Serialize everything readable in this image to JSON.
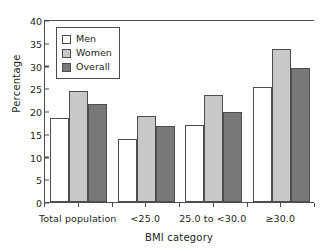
{
  "chart_data": {
    "type": "bar",
    "title": "",
    "xlabel": "BMI category",
    "ylabel": "Percentage",
    "ylim": [
      0,
      40
    ],
    "yticks": [
      0,
      5,
      10,
      15,
      20,
      25,
      30,
      35,
      40
    ],
    "grid": false,
    "legend_position": "upper left (inside axes)",
    "categories": [
      "Total population",
      "<25.0",
      "25.0 to <30.0",
      "≥30.0"
    ],
    "series": [
      {
        "name": "Men",
        "color": "#ffffff",
        "values": [
          18.4,
          13.9,
          17.0,
          25.2
        ]
      },
      {
        "name": "Women",
        "color": "#c8c8c8",
        "values": [
          24.4,
          18.8,
          23.5,
          33.7
        ]
      },
      {
        "name": "Overall",
        "color": "#787878",
        "values": [
          21.5,
          16.8,
          19.8,
          29.4
        ]
      }
    ]
  },
  "colors": {
    "men": "#ffffff",
    "women": "#c8c8c8",
    "overall": "#787878",
    "axis": "#4d4d4d",
    "text": "#231f20",
    "background": "#ffffff"
  }
}
